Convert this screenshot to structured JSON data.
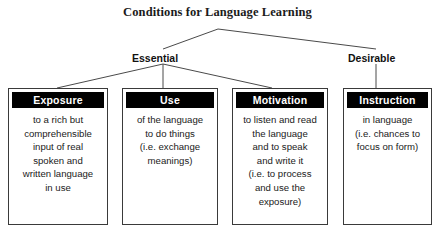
{
  "diagram": {
    "title": "Conditions for Language Learning",
    "branches": [
      {
        "id": "essential",
        "label": "Essential"
      },
      {
        "id": "desirable",
        "label": "Desirable"
      }
    ],
    "nodes": [
      {
        "id": "exposure",
        "parent": "Essential",
        "header": "Exposure",
        "lines": [
          "to a rich but",
          "comprehensible",
          "input of real",
          "spoken and",
          "written language",
          "in use"
        ]
      },
      {
        "id": "use",
        "parent": "Essential",
        "header": "Use",
        "lines": [
          "of the language",
          "to do things",
          "(i.e. exchange",
          "meanings)"
        ]
      },
      {
        "id": "motivation",
        "parent": "Essential",
        "header": "Motivation",
        "lines": [
          "to listen and read",
          "the language",
          "and to speak",
          "and write it",
          "(i.e. to process",
          "and use the",
          "exposure)"
        ]
      },
      {
        "id": "instruction",
        "parent": "Desirable",
        "header": "Instruction",
        "lines": [
          "in language",
          "(i.e. chances to",
          "focus on form)"
        ]
      }
    ],
    "colors": {
      "header_background": "#000000",
      "header_text": "#ffffff",
      "box_border": "#3a3a3a",
      "connector": "#4a4a4a",
      "page_background": "#ffffff",
      "title_text": "#1b1b1b"
    }
  }
}
